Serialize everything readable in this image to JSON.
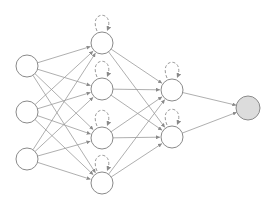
{
  "diagram": {
    "type": "recurrent-neural-network",
    "colors": {
      "background": "#ffffff",
      "node_stroke": "#8a8a8a",
      "node_fill": "#ffffff",
      "output_fill": "#dcdcdc",
      "edge": "#9a9a9a",
      "loop": "#9a9a9a"
    },
    "node_radius": 11,
    "layers": [
      {
        "name": "input",
        "x": 27,
        "ys": [
          66,
          112,
          159
        ],
        "recurrent": false
      },
      {
        "name": "hidden-1",
        "x": 102,
        "ys": [
          43,
          89,
          138,
          183
        ],
        "recurrent": true
      },
      {
        "name": "hidden-2",
        "x": 172,
        "ys": [
          90,
          137
        ],
        "recurrent": true
      },
      {
        "name": "output",
        "x": 248,
        "ys": [
          108
        ],
        "recurrent": false
      }
    ]
  }
}
